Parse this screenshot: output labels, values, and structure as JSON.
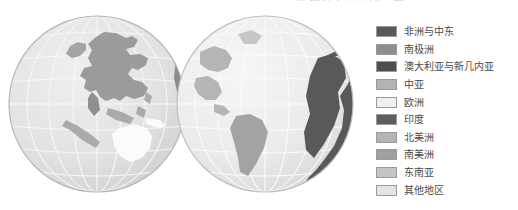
{
  "figure": {
    "title_remnant": "各地区人口占比示意",
    "width": 518,
    "height": 210,
    "background": "#ffffff"
  },
  "globes": {
    "left": {
      "name": "eastern-hemisphere-globe",
      "center_x": 97,
      "center_y": 104,
      "radius": 88,
      "ocean_color": "#e3e3e3",
      "graticule_color": "#f7f7f7",
      "outline_color": "#b4b4b4",
      "regions": [
        {
          "name": "asia",
          "color": "#9b9b9b"
        },
        {
          "name": "southeast-asia",
          "color": "#b0b0b0"
        },
        {
          "name": "australia-and-new-guinea",
          "color": "#fbfbfb"
        },
        {
          "name": "india",
          "color": "#8f8f8f"
        },
        {
          "name": "other-regions",
          "color": "#d5d5d5"
        }
      ]
    },
    "right": {
      "name": "western-hemisphere-globe",
      "center_x": 265,
      "center_y": 104,
      "radius": 88,
      "ocean_color": "#ebebeb",
      "graticule_color": "#fbfbfb",
      "outline_color": "#bdbdbd",
      "regions": [
        {
          "name": "africa-and-middle-east",
          "color": "#595959"
        },
        {
          "name": "north-america",
          "color": "#b5b5b5"
        },
        {
          "name": "south-america",
          "color": "#a3a3a3"
        },
        {
          "name": "other-regions",
          "color": "#d0d0d0"
        }
      ]
    }
  },
  "legend": {
    "name": "region-legend",
    "items": [
      {
        "label": "非洲与中东",
        "color": "#595959"
      },
      {
        "label": "南极洲",
        "color": "#8e8e8e"
      },
      {
        "label": "澳大利亚与新几内亚",
        "color": "#4f4f4f"
      },
      {
        "label": "中亚",
        "color": "#b3b3b3"
      },
      {
        "label": "欧洲",
        "color": "#f0f0f0"
      },
      {
        "label": "印度",
        "color": "#5e5e5e"
      },
      {
        "label": "北美洲",
        "color": "#b5b5b5"
      },
      {
        "label": "南美洲",
        "color": "#a0a0a0"
      },
      {
        "label": "东南亚",
        "color": "#c4c4c4"
      },
      {
        "label": "其他地区",
        "color": "#e3e3e3"
      }
    ]
  }
}
